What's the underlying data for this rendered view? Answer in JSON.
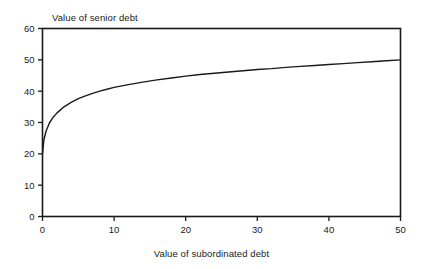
{
  "figure": {
    "title": "Value of senior debt",
    "xlabel": "Value of subordinated debt",
    "ylabel": "",
    "background_color": "#ffffff",
    "line_color": "#1a1a1a",
    "axis_color": "#1a1a1a"
  },
  "chart_data": {
    "type": "line",
    "title": "Value of senior debt",
    "xlabel": "Value of subordinated debt",
    "ylabel": "Value of senior debt",
    "xlim": [
      0,
      50
    ],
    "ylim": [
      0,
      60
    ],
    "xticks": [
      0,
      10,
      20,
      30,
      40,
      50
    ],
    "yticks": [
      0,
      10,
      20,
      30,
      40,
      50,
      60
    ],
    "xtick_labels": [
      "0",
      "10",
      "20",
      "30",
      "40",
      "50"
    ],
    "ytick_labels": [
      "0",
      "10",
      "20",
      "30",
      "40",
      "50",
      "60"
    ],
    "grid": false,
    "legend": false,
    "frame": true,
    "tick_direction": "out",
    "series": [
      {
        "name": "Value of senior debt",
        "x": [
          0,
          0.2,
          0.5,
          1,
          1.5,
          2,
          3,
          4,
          5,
          6,
          7,
          8,
          9,
          10,
          12,
          14,
          16,
          18,
          20,
          22,
          24,
          26,
          28,
          30,
          32,
          34,
          36,
          38,
          40,
          42,
          44,
          46,
          48,
          50
        ],
        "y": [
          20.0,
          24.5,
          27.3,
          30.0,
          31.7,
          33.0,
          35.0,
          36.4,
          37.6,
          38.5,
          39.3,
          40.0,
          40.6,
          41.2,
          42.1,
          42.9,
          43.6,
          44.2,
          44.8,
          45.3,
          45.7,
          46.1,
          46.5,
          46.9,
          47.2,
          47.6,
          47.9,
          48.2,
          48.5,
          48.8,
          49.1,
          49.4,
          49.7,
          50.0
        ]
      }
    ],
    "annotations": []
  }
}
